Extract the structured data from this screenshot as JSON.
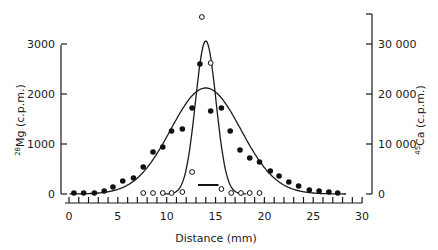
{
  "chart_data": {
    "type": "scatter",
    "title": "",
    "xlabel": "Distance (mm)",
    "ylabel_left": "28Mg (c.p.m.)",
    "ylabel_right": "45Ca (c.p.m.)",
    "xlim": [
      0,
      30
    ],
    "ylim_left": [
      0,
      3600
    ],
    "ylim_right": [
      0,
      36000
    ],
    "x_ticks": [
      0,
      5,
      10,
      15,
      20,
      25,
      30
    ],
    "x_tick_labels": [
      "0",
      "5",
      "10",
      "15",
      "20",
      "25",
      "30"
    ],
    "y_left_ticks": [
      0,
      1000,
      2000,
      3000
    ],
    "y_left_tick_labels": [
      "0",
      "1000",
      "2000",
      "3000"
    ],
    "y_right_ticks": [
      0,
      10000,
      20000,
      30000
    ],
    "y_right_tick_labels": [
      "0",
      "10 000",
      "20 000",
      "30 000"
    ],
    "grid": false,
    "legend": null,
    "series": [
      {
        "name": "28Mg",
        "axis": "left",
        "marker": "filled-circle",
        "x": [
          0.5,
          1.5,
          2.6,
          3.6,
          4.5,
          5.5,
          6.6,
          7.6,
          8.6,
          9.6,
          10.5,
          11.6,
          12.6,
          13.4,
          14.5,
          15.6,
          16.5,
          17.5,
          18.5,
          19.5,
          20.6,
          21.5,
          22.5,
          23.5,
          24.6,
          25.6,
          26.6,
          27.5
        ],
        "y": [
          20,
          20,
          20,
          60,
          140,
          260,
          320,
          540,
          840,
          940,
          1260,
          1300,
          1720,
          2600,
          1660,
          1720,
          1260,
          880,
          720,
          640,
          460,
          360,
          240,
          160,
          80,
          60,
          40,
          20
        ]
      },
      {
        "name": "45Ca",
        "axis": "right",
        "marker": "open-circle",
        "x": [
          7.6,
          8.6,
          9.6,
          10.5,
          11.6,
          12.6,
          13.6,
          14.5,
          15.6,
          16.6,
          17.6,
          18.5,
          19.5
        ],
        "y": [
          200,
          200,
          200,
          200,
          400,
          4400,
          35400,
          26200,
          1000,
          200,
          200,
          200,
          200
        ]
      },
      {
        "name": "28Mg fitted curve",
        "axis": "left",
        "type": "line",
        "peak_x": 14.0,
        "peak_y": 2120,
        "sigma_mm": 3.6
      },
      {
        "name": "45Ca fitted curve",
        "axis": "right",
        "type": "line",
        "peak_x": 14.0,
        "peak_y": 30600,
        "sigma_mm": 1.05
      }
    ],
    "annotations": [
      {
        "type": "horizontal-bar",
        "x_start": 13.2,
        "x_end": 15.3,
        "y_left": 180,
        "description": "application site marker"
      }
    ]
  },
  "labels": {
    "xlabel": "Distance (mm)",
    "ylabel_left_sup": "28",
    "ylabel_left_main": "Mg (c.p.m.)",
    "ylabel_right_sup": "45",
    "ylabel_right_main": "Ca (c.p.m.)"
  }
}
